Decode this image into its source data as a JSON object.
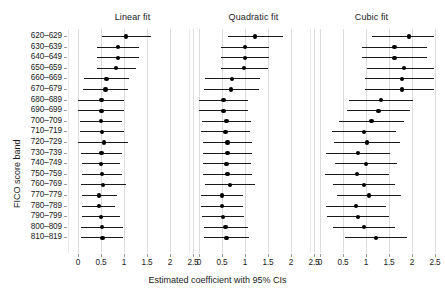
{
  "chart_data": {
    "type": "scatter",
    "plot_kind": "forest-plot-coefficient-intervals",
    "title": "",
    "xlabel": "Estimated coefficient with 95% CIs",
    "ylabel": "FICO score band",
    "xlim": [
      -0.28,
      2.72
    ],
    "xticks": [
      0,
      0.5,
      1,
      1.5,
      2,
      2.5
    ],
    "xticklabels": [
      "0",
      "0.5",
      "1",
      "1.5",
      "2",
      "2.5"
    ],
    "grid": "vertical-only",
    "legend": "none",
    "categories": [
      "620–629",
      "630–639",
      "640–649",
      "650–659",
      "660–669",
      "670–679",
      "680–689",
      "690–699",
      "700–709",
      "710–719",
      "720–729",
      "730–739",
      "740–749",
      "750–759",
      "760–769",
      "770–779",
      "780–789",
      "790–799",
      "800–809",
      "810–819"
    ],
    "panels": [
      {
        "name": "linear",
        "label": "Linear fit",
        "estimates": [
          1.05,
          0.87,
          0.87,
          0.82,
          0.62,
          0.6,
          0.51,
          0.51,
          0.5,
          0.52,
          0.56,
          0.51,
          0.5,
          0.52,
          0.55,
          0.46,
          0.45,
          0.5,
          0.52,
          0.53
        ],
        "ci_low": [
          0.52,
          0.41,
          0.41,
          0.41,
          0.12,
          0.1,
          0.0,
          0.0,
          0.04,
          0.04,
          0.0,
          0.07,
          0.09,
          0.08,
          0.07,
          0.08,
          0.09,
          0.09,
          0.07,
          0.07
        ],
        "ci_high": [
          1.58,
          1.33,
          1.33,
          1.26,
          1.11,
          1.09,
          1.0,
          1.0,
          0.96,
          1.0,
          1.08,
          0.96,
          0.92,
          0.96,
          1.04,
          0.85,
          0.81,
          0.92,
          0.97,
          0.98
        ]
      },
      {
        "name": "quadratic",
        "label": "Quadratic fit",
        "estimates": [
          1.22,
          1.0,
          1.0,
          0.98,
          0.72,
          0.7,
          0.53,
          0.53,
          0.6,
          0.58,
          0.62,
          0.62,
          0.6,
          0.62,
          0.67,
          0.5,
          0.5,
          0.52,
          0.58,
          0.6
        ],
        "ci_low": [
          0.62,
          0.47,
          0.47,
          0.47,
          0.12,
          0.1,
          0.0,
          0.0,
          0.07,
          0.05,
          0.09,
          0.09,
          0.08,
          0.09,
          0.13,
          0.05,
          0.05,
          0.07,
          0.1,
          0.11
        ],
        "ci_high": [
          1.82,
          1.53,
          1.53,
          1.49,
          1.32,
          1.3,
          1.06,
          1.06,
          1.13,
          1.11,
          1.15,
          1.15,
          1.12,
          1.15,
          1.21,
          0.95,
          0.95,
          0.97,
          1.06,
          1.09
        ]
      },
      {
        "name": "cubic",
        "label": "Cubic fit",
        "estimates": [
          1.93,
          1.62,
          1.62,
          1.82,
          1.78,
          1.78,
          1.32,
          1.27,
          1.12,
          0.95,
          1.02,
          0.82,
          1.0,
          0.8,
          0.95,
          1.07,
          0.78,
          0.82,
          0.95,
          1.22,
          1.52
        ],
        "ci_low": [
          1.12,
          0.92,
          0.92,
          1.02,
          0.98,
          0.98,
          0.62,
          0.58,
          0.42,
          0.25,
          0.3,
          0.12,
          0.32,
          0.1,
          0.28,
          0.38,
          0.12,
          0.15,
          0.28,
          0.55,
          0.82
        ],
        "ci_high": [
          2.74,
          2.32,
          2.32,
          2.62,
          2.58,
          2.58,
          2.02,
          1.96,
          1.82,
          1.65,
          1.74,
          1.52,
          1.68,
          1.5,
          1.62,
          1.76,
          1.44,
          1.49,
          1.62,
          1.89,
          2.22
        ]
      }
    ]
  },
  "figure": {
    "panel_titles": [
      "Linear fit",
      "Quadratic fit",
      "Cubic fit"
    ],
    "x_axis_title": "Estimated coefficient with 95% CIs",
    "y_axis_title": "FICO score band"
  }
}
